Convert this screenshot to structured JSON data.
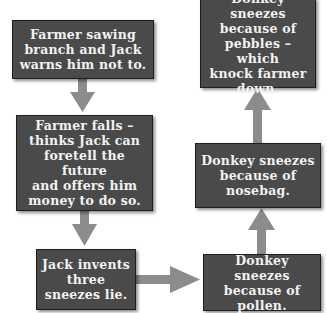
{
  "diagram": {
    "type": "flowchart",
    "colors": {
      "box_fill": "#4a4a4a",
      "box_text": "#f2f2f2",
      "arrow": "#8c8c8c",
      "background": "#ffffff"
    },
    "nodes": [
      {
        "id": "n1",
        "label": "Farmer sawing\nbranch and Jack\nwarns him not to."
      },
      {
        "id": "n2",
        "label": "Farmer falls –\nthinks Jack can\nforetell the future\nand offers him\nmoney to do so."
      },
      {
        "id": "n3",
        "label": "Jack invents\nthree\nsneezes lie."
      },
      {
        "id": "n4",
        "label": "Donkey sneezes\nbecause of\npollen."
      },
      {
        "id": "n5",
        "label": "Donkey sneezes\nbecause of\nnosebag."
      },
      {
        "id": "n6",
        "label": "Donkey sneezes\nbecause of\npebbles – which\nknock farmer\ndown."
      }
    ],
    "edges": [
      {
        "from": "n1",
        "to": "n2",
        "direction": "down"
      },
      {
        "from": "n2",
        "to": "n3",
        "direction": "down"
      },
      {
        "from": "n3",
        "to": "n4",
        "direction": "right"
      },
      {
        "from": "n4",
        "to": "n5",
        "direction": "up"
      },
      {
        "from": "n5",
        "to": "n6",
        "direction": "up"
      }
    ]
  }
}
